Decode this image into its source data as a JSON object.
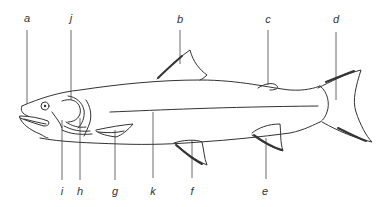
{
  "diagram": {
    "labels": [
      {
        "id": "a",
        "text": "a",
        "x": 27,
        "y": 13
      },
      {
        "id": "j",
        "text": "j",
        "x": 71,
        "y": 13
      },
      {
        "id": "b",
        "text": "b",
        "x": 180,
        "y": 14
      },
      {
        "id": "c",
        "text": "c",
        "x": 268,
        "y": 14
      },
      {
        "id": "d",
        "text": "d",
        "x": 336,
        "y": 14
      },
      {
        "id": "i",
        "text": "i",
        "x": 62,
        "y": 186
      },
      {
        "id": "h",
        "text": "h",
        "x": 80,
        "y": 186
      },
      {
        "id": "g",
        "text": "g",
        "x": 115,
        "y": 186
      },
      {
        "id": "k",
        "text": "k",
        "x": 153,
        "y": 186
      },
      {
        "id": "f",
        "text": "f",
        "x": 192,
        "y": 186
      },
      {
        "id": "e",
        "text": "e",
        "x": 265,
        "y": 186
      }
    ]
  }
}
